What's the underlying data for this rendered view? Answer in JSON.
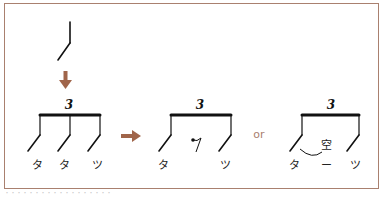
{
  "colors": {
    "frame": "#a9806f",
    "arrow": "#a0654a",
    "ink": "#111111",
    "or_text": "#a9806f"
  },
  "top_figure": {
    "description": "single eighth-note stem with flag (stroke)",
    "arrow_direction": "down"
  },
  "groups": [
    {
      "id": "triplet-full",
      "tuplet_number": "3",
      "syllables": [
        "タ",
        "タ",
        "ツ"
      ]
    },
    {
      "id": "triplet-rest",
      "tuplet_number": "3",
      "syllables": [
        "タ",
        "ツ"
      ],
      "middle_symbol": "eighth-rest"
    },
    {
      "id": "triplet-tie",
      "tuplet_number": "3",
      "syllables": [
        "タ",
        "ー",
        "ツ"
      ],
      "annotation": "空"
    }
  ],
  "connectors": {
    "arrow_right": "right-arrow",
    "or_label": "or"
  },
  "caption": "・・・・・・・・・・・・・・・・・・"
}
